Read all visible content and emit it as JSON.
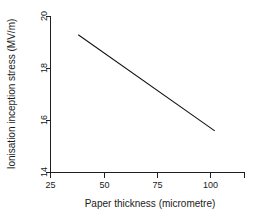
{
  "chart_data": {
    "type": "line",
    "title": "",
    "xlabel": "Paper thickness (micrometre)",
    "ylabel": "Ionisation inception stress (MV/m)",
    "xlim": [
      25,
      116
    ],
    "ylim": [
      14,
      20
    ],
    "xticks": [
      25,
      50,
      75,
      100
    ],
    "xticklabels": [
      "25",
      "50",
      "75",
      "100"
    ],
    "yticks": [
      14,
      16,
      18,
      20
    ],
    "yticklabels": [
      "14",
      "16",
      "18",
      "20"
    ],
    "grid": false,
    "legend": null,
    "series": [
      {
        "name": "Ionisation inception stress",
        "x": [
          38,
          102
        ],
        "values": [
          19.3,
          15.6
        ],
        "color": "#111111",
        "marker": "none"
      }
    ],
    "annotations": []
  },
  "axes": {
    "y_title": "Ionisation inception stress (MV/m)",
    "x_title": "Paper thickness (micrometre)",
    "y_tick_0": "14",
    "y_tick_1": "16",
    "y_tick_2": "18",
    "y_tick_3": "20",
    "x_tick_0": "25",
    "x_tick_1": "50",
    "x_tick_2": "75",
    "x_tick_3": "100"
  }
}
